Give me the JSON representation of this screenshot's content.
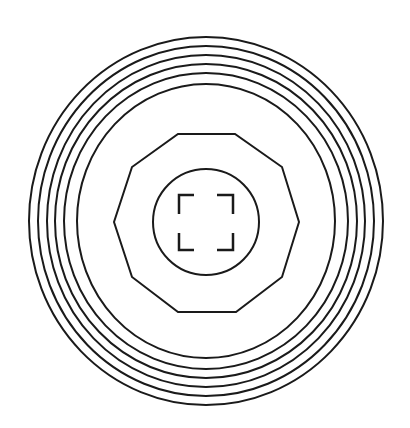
{
  "diagram": {
    "stroke_color": "#1a1a1a",
    "background": "#ffffff",
    "stroke_width": 2,
    "center": {
      "x": 206,
      "y": 221
    },
    "rings": [
      {
        "rx": 177,
        "ry": 184
      },
      {
        "rx": 168,
        "ry": 175
      },
      {
        "rx": 159,
        "ry": 166
      },
      {
        "rx": 151,
        "ry": 157
      },
      {
        "rx": 142,
        "ry": 148
      },
      {
        "rx": 129,
        "ry": 137
      }
    ],
    "decagon": {
      "points": "178,134 235,134 282,167 299,222 282,277 236,312 178,312 132,277 114,222 132,167"
    },
    "inner_circle": {
      "cx": 206,
      "cy": 222,
      "r": 53
    },
    "brackets": [
      {
        "name": "top-left",
        "d": "M194,195 L179,195 L179,214"
      },
      {
        "name": "top-right",
        "d": "M217,195 L233,195 L233,214"
      },
      {
        "name": "bottom-left",
        "d": "M179,233 L179,250 L194,250"
      },
      {
        "name": "bottom-right",
        "d": "M233,233 L233,250 L217,250"
      }
    ]
  }
}
